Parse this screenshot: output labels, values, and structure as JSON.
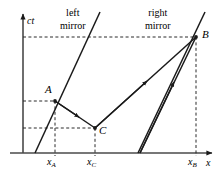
{
  "figure": {
    "type": "spacetime-diagram",
    "background_color": "#ffffff",
    "line_color": "#1a1a1a"
  },
  "axes": {
    "vertical_label": "ct",
    "horizontal_label": "x",
    "origin_px": {
      "x": 23,
      "y": 153
    },
    "vertical_top_px": 12,
    "horizontal_right_px": 214
  },
  "worldlines": [
    {
      "name": "left-mirror",
      "label_line1": "left",
      "label_line2": "mirror",
      "label_pos_px": {
        "x": 62,
        "y": 9
      },
      "from_px": {
        "x": 35,
        "y": 153
      },
      "to_px": {
        "x": 100,
        "y": 12
      }
    },
    {
      "name": "right-mirror",
      "label_line1": "right",
      "label_line2": "mirror",
      "label_pos_px": {
        "x": 148,
        "y": 9
      },
      "from_px": {
        "x": 138,
        "y": 153
      },
      "to_px": {
        "x": 205,
        "y": 12
      }
    }
  ],
  "points": [
    {
      "id": "A",
      "label": "A",
      "px": {
        "x": 55,
        "y": 101
      },
      "label_px": {
        "x": 45,
        "y": 86
      }
    },
    {
      "id": "C",
      "label": "C",
      "px": {
        "x": 95,
        "y": 128
      },
      "label_px": {
        "x": 99,
        "y": 126
      }
    },
    {
      "id": "B",
      "label": "B",
      "px": {
        "x": 196,
        "y": 37
      },
      "label_px": {
        "x": 202,
        "y": 31
      }
    }
  ],
  "light_rays": [
    {
      "name": "ray-A-to-C",
      "from": "A",
      "to": "C",
      "direction": "down-right",
      "arrow_at": 0.55
    },
    {
      "name": "ray-C-to-B",
      "from": "C",
      "to": "B",
      "direction": "up-right",
      "arrow_at": 0.52
    },
    {
      "name": "ray-origin-to-B",
      "from": "x-axis",
      "to": "B",
      "direction": "up-right",
      "arrow_at": 0.62
    }
  ],
  "guide_lines": {
    "style": "dashed",
    "horizontal": [
      {
        "name": "ct-level-B",
        "y_px": 37,
        "from_x_px": 23,
        "to_x_px": 196
      },
      {
        "name": "ct-level-A",
        "y_px": 101,
        "from_x_px": 23,
        "to_x_px": 55
      },
      {
        "name": "ct-level-C",
        "y_px": 128,
        "from_x_px": 23,
        "to_x_px": 95
      }
    ],
    "vertical": [
      {
        "name": "x-A-drop",
        "x_px": 55,
        "from_y_px": 101,
        "to_y_px": 153
      },
      {
        "name": "x-C-drop",
        "x_px": 95,
        "from_y_px": 128,
        "to_y_px": 153
      },
      {
        "name": "x-B-drop",
        "x_px": 196,
        "from_y_px": 37,
        "to_y_px": 153
      }
    ]
  },
  "tick_labels": [
    {
      "name": "x-A",
      "base": "x",
      "sub": "A",
      "x_px": 48,
      "y_px": 156
    },
    {
      "name": "x-C",
      "base": "x",
      "sub": "C",
      "x_px": 88,
      "y_px": 156
    },
    {
      "name": "x-B",
      "base": "x",
      "sub": "B",
      "x_px": 189,
      "y_px": 156
    }
  ]
}
